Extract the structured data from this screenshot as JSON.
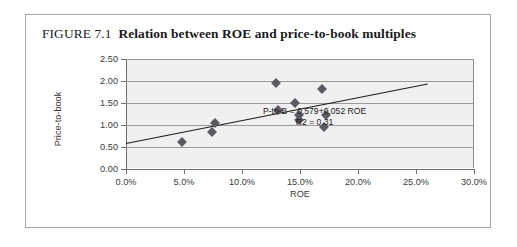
{
  "figure": {
    "label": "FIGURE 7.1",
    "caption": "Relation between ROE and price-to-book multiples"
  },
  "chart_data": {
    "type": "scatter",
    "title": "Relation between ROE and price-to-book multiples",
    "xlabel": "ROE",
    "ylabel": "Price-to-book",
    "xlim": [
      0.0,
      30.0
    ],
    "ylim": [
      0.0,
      2.5
    ],
    "xticks": [
      0.0,
      5.0,
      10.0,
      15.0,
      20.0,
      25.0,
      30.0
    ],
    "xtick_labels": [
      "0.0%",
      "5.0%",
      "10.0%",
      "15.0%",
      "20.0%",
      "25.0%",
      "30.0%"
    ],
    "yticks": [
      0.0,
      0.5,
      1.0,
      1.5,
      2.0,
      2.5
    ],
    "ytick_labels": [
      "0.00",
      "0.50",
      "1.00",
      "1.50",
      "2.00",
      "2.50"
    ],
    "grid": "horizontal",
    "legend": "none",
    "points": [
      {
        "x": 4.8,
        "y": 0.62
      },
      {
        "x": 7.4,
        "y": 0.83
      },
      {
        "x": 7.7,
        "y": 1.05
      },
      {
        "x": 12.9,
        "y": 1.95
      },
      {
        "x": 13.1,
        "y": 1.34
      },
      {
        "x": 14.6,
        "y": 1.5
      },
      {
        "x": 14.9,
        "y": 1.22
      },
      {
        "x": 14.9,
        "y": 1.11
      },
      {
        "x": 16.9,
        "y": 1.82
      },
      {
        "x": 17.2,
        "y": 1.22
      },
      {
        "x": 17.1,
        "y": 0.95
      }
    ],
    "trendline": {
      "intercept": 0.579,
      "slope": 0.052,
      "x_start": 0.0,
      "x_end": 26.0,
      "r_squared": 0.31
    },
    "annotation": {
      "equation": "P-to-B = 0.579+0.052 ROE",
      "r2": "R2 = 0.31"
    }
  }
}
